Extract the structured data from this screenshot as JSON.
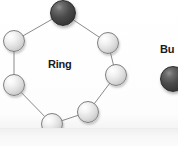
{
  "diagram": {
    "type": "network-topology",
    "background_color": "#fefefe",
    "edge_color": "#8a8a8a",
    "primary": {
      "label": "Ring",
      "label_x": 48,
      "label_y": 58,
      "nodes": [
        {
          "id": "n1",
          "shade": "dark",
          "cx": 63,
          "cy": 13,
          "r": 13
        },
        {
          "id": "n2",
          "shade": "light",
          "cx": 108,
          "cy": 43,
          "r": 11
        },
        {
          "id": "n3",
          "shade": "light",
          "cx": 116,
          "cy": 75,
          "r": 11
        },
        {
          "id": "n4",
          "shade": "light",
          "cx": 88,
          "cy": 112,
          "r": 11
        },
        {
          "id": "n5",
          "shade": "light",
          "cx": 52,
          "cy": 124,
          "r": 11
        },
        {
          "id": "n6",
          "shade": "light",
          "cx": 14,
          "cy": 85,
          "r": 11
        },
        {
          "id": "n7",
          "shade": "light",
          "cx": 14,
          "cy": 41,
          "r": 11
        }
      ],
      "edges": [
        {
          "from": "n1",
          "to": "n2"
        },
        {
          "from": "n2",
          "to": "n3"
        },
        {
          "from": "n3",
          "to": "n4"
        },
        {
          "from": "n4",
          "to": "n5"
        },
        {
          "from": "n5",
          "to": "n6"
        },
        {
          "from": "n6",
          "to": "n7"
        },
        {
          "from": "n7",
          "to": "n1"
        }
      ]
    },
    "secondary": {
      "label": "Bu",
      "label_x": 160,
      "label_y": 43,
      "clipped": true,
      "nodes": [
        {
          "id": "b1",
          "shade": "dark",
          "cx": 173,
          "cy": 79,
          "r": 13
        }
      ]
    }
  }
}
